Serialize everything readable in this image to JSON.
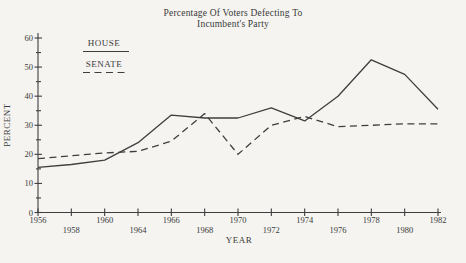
{
  "title": {
    "line1": "Percentage Of Voters Defecting To",
    "line2": "Incumbent's Party"
  },
  "legend": {
    "house": "HOUSE",
    "senate": "SENATE"
  },
  "axes": {
    "x_label": "YEAR",
    "y_label": "PERCENT",
    "y_ticks": [
      0,
      10,
      20,
      30,
      40,
      50,
      60
    ],
    "y_minor_ticks": [
      5,
      15,
      25,
      35,
      45,
      55
    ]
  },
  "colors": {
    "ink": "#3e3e3e",
    "paper": "#f5f4f1"
  },
  "chart_data": {
    "type": "line",
    "title": "Percentage Of Voters Defecting To Incumbent's Party",
    "xlabel": "YEAR",
    "ylabel": "PERCENT",
    "ylim": [
      0,
      60
    ],
    "grid": false,
    "legend_position": "top-left",
    "categories": [
      "1956",
      "1958",
      "1960",
      "1964",
      "1966",
      "1968",
      "1970",
      "1972",
      "1974",
      "1976",
      "1978",
      "1980",
      "1982"
    ],
    "series": [
      {
        "name": "HOUSE",
        "style": "solid",
        "values": [
          15.5,
          16.5,
          18,
          24,
          33.5,
          32.5,
          32.5,
          36,
          31.5,
          40,
          52.5,
          47.5,
          35.5
        ]
      },
      {
        "name": "SENATE",
        "style": "dashed",
        "values": [
          18.5,
          19.5,
          20.5,
          21,
          24.5,
          34,
          20,
          30,
          33,
          29.5,
          30,
          30.5,
          30.5
        ]
      }
    ]
  }
}
